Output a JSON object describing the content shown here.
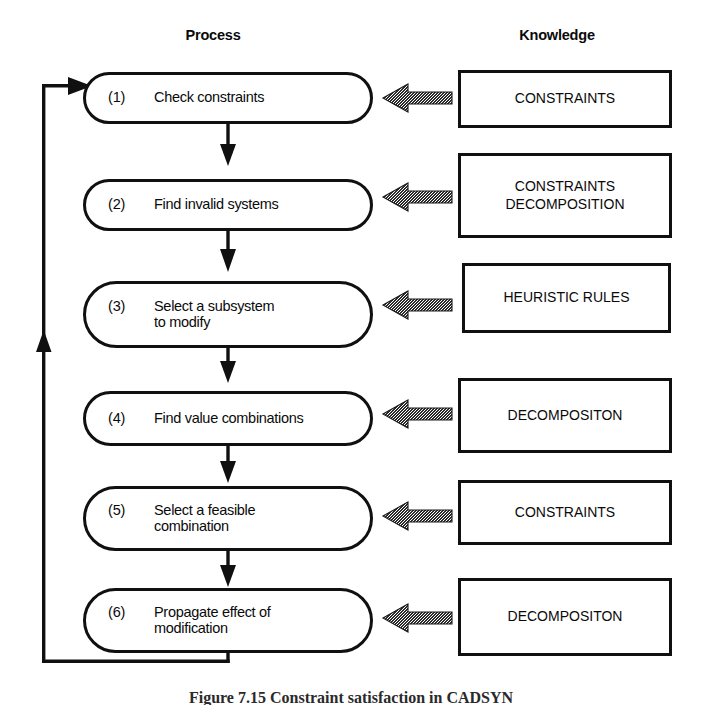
{
  "figure": {
    "caption": "Figure 7.15  Constraint satisfaction in CADSYN",
    "background_color": "#ffffff",
    "ink_color": "#101010"
  },
  "columns": {
    "process_heading": "Process",
    "knowledge_heading": "Knowledge"
  },
  "process_steps": [
    {
      "number": "(1)",
      "label": "Check constraints"
    },
    {
      "number": "(2)",
      "label": "Find invalid systems"
    },
    {
      "number": "(3)",
      "label": "Select a subsystem\nto modify"
    },
    {
      "number": "(4)",
      "label": "Find value combinations"
    },
    {
      "number": "(5)",
      "label": "Select a feasible\ncombination"
    },
    {
      "number": "(6)",
      "label": "Propagate effect of\nmodification"
    }
  ],
  "knowledge_sources": [
    {
      "label": "CONSTRAINTS"
    },
    {
      "label": "CONSTRAINTS\nDECOMPOSITION"
    },
    {
      "label": "HEURISTIC RULES"
    },
    {
      "label": "DECOMPOSITON"
    },
    {
      "label": "CONSTRAINTS"
    },
    {
      "label": "DECOMPOSITON"
    }
  ],
  "connectors": {
    "step_flow_arrows": 5,
    "knowledge_arrows": 6,
    "feedback_loop_label": "feedback from step 6 back to step 1"
  }
}
